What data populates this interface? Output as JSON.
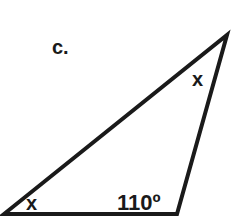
{
  "problem": {
    "label": "c.",
    "angles": {
      "top": "x",
      "bottom_left": "x",
      "bottom_right": "110º"
    }
  },
  "colors": {
    "stroke": "#1a1a1a",
    "background": "#ffffff"
  }
}
